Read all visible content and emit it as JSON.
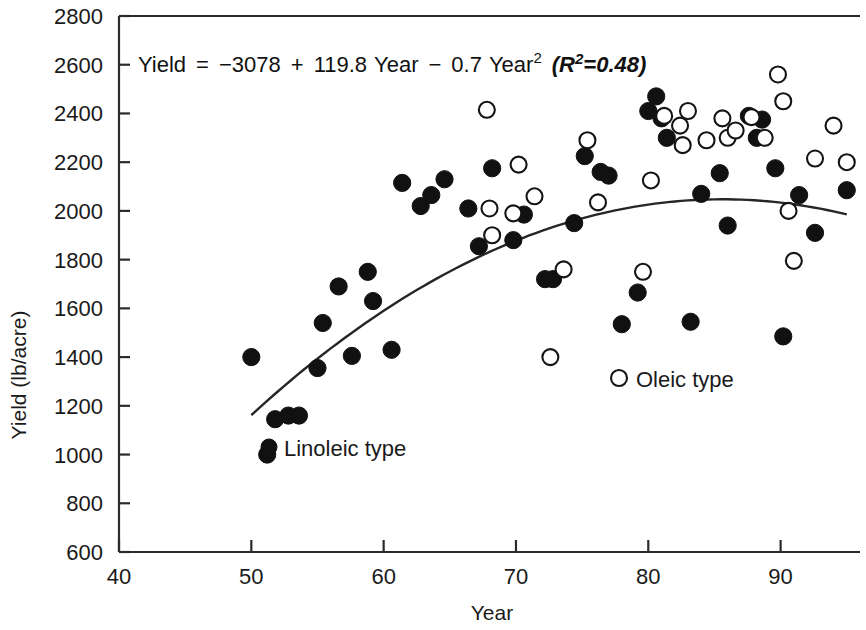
{
  "chart_data": {
    "type": "scatter",
    "title": "",
    "xlabel": "Year",
    "ylabel": "Yield (lb/acre)",
    "xlim": [
      40,
      96
    ],
    "ylim": [
      600,
      2800
    ],
    "xticks": [
      40,
      50,
      60,
      70,
      80,
      90
    ],
    "xtick_labels": [
      "40",
      "50",
      "60",
      "70",
      "80",
      "90"
    ],
    "yticks": [
      600,
      800,
      1000,
      1200,
      1400,
      1600,
      1800,
      2000,
      2200,
      2400,
      2600,
      2800
    ],
    "ytick_labels": [
      "600",
      "800",
      "1000",
      "1200",
      "1400",
      "1600",
      "1800",
      "2000",
      "2200",
      "2400",
      "2600",
      "2800"
    ],
    "grid": false,
    "annotation": {
      "equation_plain": "Yield = −3078 + 119.8 Year − 0.7 Year² (R²=0.48)",
      "lhs": "Yield",
      "equals": "=",
      "intercept": "−3078",
      "plus": "+",
      "linear_coef": "119.8",
      "linear_var": "Year",
      "minus": "−",
      "quad_coef": "0.7",
      "quad_var": "Year",
      "quad_exponent": "2",
      "r_open_paren": "(",
      "r_symbol": "R",
      "r_exponent": "2",
      "r_equals": "=",
      "r_value": "0.48",
      "r_close_paren": ")"
    },
    "fit": {
      "model": "quadratic",
      "intercept": -3078,
      "linear": 119.8,
      "quadratic": -0.7,
      "r_squared": 0.48,
      "x_start": 50,
      "x_end": 95
    },
    "legend": {
      "position": "inside-lower-right-and-lower-left",
      "entries": [
        {
          "name": "Linoleic type",
          "marker": "filled-circle",
          "color": "#111111"
        },
        {
          "name": "Oleic type",
          "marker": "open-circle",
          "color": "#ffffff"
        }
      ]
    },
    "series": [
      {
        "name": "Linoleic type",
        "marker": "filled-circle",
        "points": [
          [
            50.0,
            1400
          ],
          [
            51.2,
            1000
          ],
          [
            51.8,
            1145
          ],
          [
            52.8,
            1160
          ],
          [
            53.6,
            1160
          ],
          [
            55.0,
            1355
          ],
          [
            55.4,
            1540
          ],
          [
            56.6,
            1690
          ],
          [
            57.6,
            1405
          ],
          [
            58.8,
            1750
          ],
          [
            59.2,
            1630
          ],
          [
            60.6,
            1430
          ],
          [
            61.4,
            2115
          ],
          [
            62.8,
            2020
          ],
          [
            63.6,
            2065
          ],
          [
            64.6,
            2130
          ],
          [
            66.4,
            2010
          ],
          [
            67.2,
            1855
          ],
          [
            68.2,
            2175
          ],
          [
            69.8,
            1880
          ],
          [
            70.6,
            1985
          ],
          [
            72.2,
            1720
          ],
          [
            72.8,
            1720
          ],
          [
            74.4,
            1950
          ],
          [
            75.2,
            2225
          ],
          [
            76.4,
            2160
          ],
          [
            77.0,
            2145
          ],
          [
            78.0,
            1535
          ],
          [
            79.2,
            1665
          ],
          [
            80.0,
            2410
          ],
          [
            80.6,
            2470
          ],
          [
            81.0,
            2380
          ],
          [
            81.4,
            2300
          ],
          [
            83.2,
            1545
          ],
          [
            84.0,
            2070
          ],
          [
            85.4,
            2155
          ],
          [
            86.0,
            1940
          ],
          [
            87.6,
            2390
          ],
          [
            88.2,
            2300
          ],
          [
            88.6,
            2375
          ],
          [
            89.6,
            2175
          ],
          [
            90.2,
            1485
          ],
          [
            91.4,
            2065
          ],
          [
            92.6,
            1910
          ],
          [
            95.0,
            2085
          ]
        ]
      },
      {
        "name": "Oleic type",
        "marker": "open-circle",
        "points": [
          [
            67.8,
            2415
          ],
          [
            68.0,
            2010
          ],
          [
            68.2,
            1900
          ],
          [
            69.8,
            1990
          ],
          [
            70.2,
            2190
          ],
          [
            71.4,
            2060
          ],
          [
            72.6,
            1400
          ],
          [
            73.6,
            1760
          ],
          [
            75.4,
            2290
          ],
          [
            76.2,
            2035
          ],
          [
            79.6,
            1750
          ],
          [
            80.2,
            2125
          ],
          [
            81.2,
            2390
          ],
          [
            82.4,
            2350
          ],
          [
            82.6,
            2270
          ],
          [
            83.0,
            2410
          ],
          [
            84.4,
            2290
          ],
          [
            85.6,
            2380
          ],
          [
            86.0,
            2300
          ],
          [
            86.6,
            2330
          ],
          [
            87.8,
            2385
          ],
          [
            88.8,
            2300
          ],
          [
            89.8,
            2560
          ],
          [
            90.2,
            2450
          ],
          [
            90.6,
            2000
          ],
          [
            91.0,
            1795
          ],
          [
            92.6,
            2215
          ],
          [
            94.0,
            2350
          ],
          [
            95.0,
            2200
          ]
        ]
      }
    ]
  }
}
